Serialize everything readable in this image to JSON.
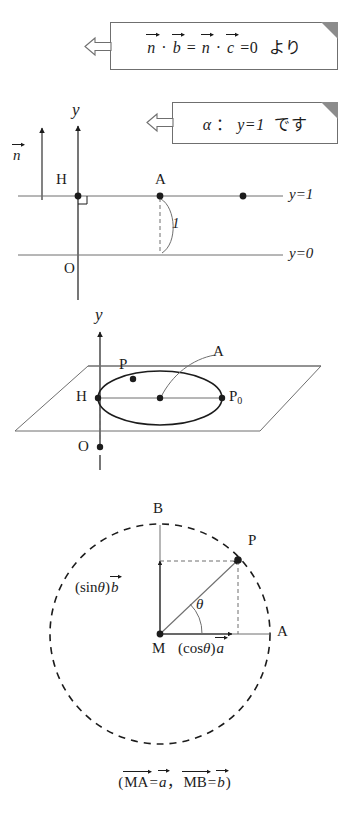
{
  "figure": {
    "ink_color": "#1c1c1c",
    "line_color": "#6f6f6f",
    "accent_color": "#8c8c8c",
    "background": "#ffffff"
  },
  "notes": [
    {
      "id": "note-dot-product",
      "arrow": "left-hollow-arrow",
      "parts": {
        "n1": "n",
        "dot1": "·",
        "b": "b",
        "eq1": "=",
        "n2": "n",
        "dot2": "·",
        "c": "c",
        "eq2": "=0",
        "tail": "より"
      },
      "plain_text": "n⃗·b⃗ = n⃗·c⃗ = 0 より"
    },
    {
      "id": "note-plane-alpha",
      "arrow": "left-hollow-arrow",
      "parts": {
        "alpha": "α",
        "colon": "：",
        "equation": "y=1",
        "tail": "です"
      },
      "plain_text": "α：y=1 です"
    }
  ],
  "diagram1": {
    "name": "plane-alpha-side-view",
    "axis_label_y": "y",
    "vector_n_label": "n",
    "point_H": "H",
    "point_A": "A",
    "point_O": "O",
    "line_label_y1": "y=1",
    "line_label_y0": "y=0",
    "distance_label": "1",
    "right_angle_mark": true,
    "dots": [
      "H",
      "A",
      "unnamed-right-dot"
    ]
  },
  "diagram2": {
    "name": "plane-with-circle-3d",
    "axis_label_y": "y",
    "point_H": "H",
    "point_P": "P",
    "point_P0": "P",
    "point_P0_sub": "0",
    "point_A": "A",
    "point_O": "O",
    "shape": "ellipse-in-parallelogram-plane"
  },
  "diagram3": {
    "name": "circle-parameterization",
    "point_M": "M",
    "point_A": "A",
    "point_B": "B",
    "point_P": "P",
    "angle_label": "θ",
    "sin_label": {
      "prefix": "(sin",
      "theta": "θ",
      "suffix": ")",
      "vector": "b"
    },
    "cos_label": {
      "prefix": "(cos",
      "theta": "θ",
      "suffix": ")",
      "vector": "a"
    },
    "circle_style": "dashed",
    "center": "M",
    "radius_px": 110
  },
  "caption": {
    "open_paren": "(",
    "MA": "MA",
    "eq1": "=",
    "a": "a",
    "comma": "，",
    "MB": "MB",
    "eq2": "=",
    "b": "b",
    "close_paren": ")",
    "plain_text": "(MA⃗ = a⃗, MB⃗ = b⃗)"
  }
}
